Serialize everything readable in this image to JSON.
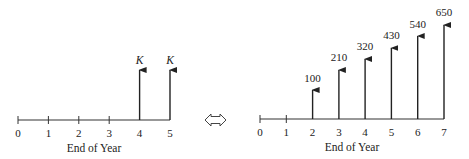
{
  "left_diagram": {
    "axis_title": "End of Year",
    "ticks": [
      "0",
      "1",
      "2",
      "3",
      "4",
      "5"
    ],
    "cash_flows": [
      {
        "year": 4,
        "label": "K"
      },
      {
        "year": 5,
        "label": "K"
      }
    ]
  },
  "equivalence_symbol": "double-arrow-icon",
  "right_diagram": {
    "axis_title": "End of Year",
    "ticks": [
      "0",
      "1",
      "2",
      "3",
      "4",
      "5",
      "6",
      "7"
    ],
    "cash_flows": [
      {
        "year": 2,
        "label": "100"
      },
      {
        "year": 3,
        "label": "210"
      },
      {
        "year": 4,
        "label": "320"
      },
      {
        "year": 5,
        "label": "430"
      },
      {
        "year": 6,
        "label": "540"
      },
      {
        "year": 7,
        "label": "650"
      }
    ]
  },
  "colors": {
    "line": "#222222",
    "background": "#ffffff"
  }
}
